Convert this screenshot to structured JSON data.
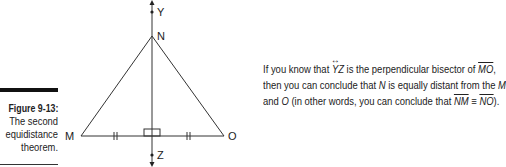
{
  "caption": {
    "figure_number": "Figure 9-13:",
    "lines": [
      "The second",
      "equidistance",
      "theorem."
    ]
  },
  "diagram": {
    "points": {
      "Y": {
        "label": "Y",
        "x": 152,
        "y": 12
      },
      "N": {
        "label": "N",
        "x": 152,
        "y": 36
      },
      "M": {
        "label": "M",
        "x": 81,
        "y": 136
      },
      "O": {
        "label": "O",
        "x": 224,
        "y": 136
      },
      "Z": {
        "label": "Z",
        "x": 152,
        "y": 155
      }
    },
    "segments": [
      "MN",
      "NO",
      "MO",
      "YZ"
    ],
    "marks": {
      "tick_marks": "double ticks on MX and XO",
      "right_angle": "at foot of perpendicular"
    }
  },
  "text": {
    "line1_a": "If you know that ",
    "line1_yz": "YZ",
    "line1_b": " is the perpendicular bisector of ",
    "line1_mo": "MO",
    "line1_c": ",",
    "line2_a": "then you can conclude that ",
    "line2_n": "N",
    "line2_b": " is equally distant from the ",
    "line2_m": "M",
    "line3_a": "and ",
    "line3_o": "O",
    "line3_b": " (in other words, you can conclude that ",
    "line3_nm": "NM",
    "line3_eq": " ≡ ",
    "line3_no": "NO",
    "line3_c": ")."
  }
}
